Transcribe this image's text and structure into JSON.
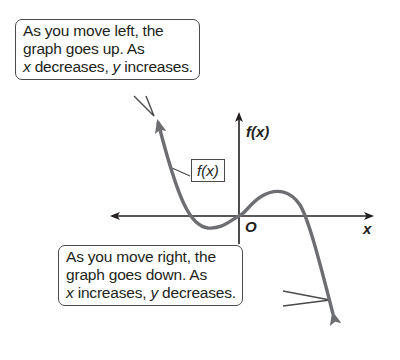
{
  "callouts": {
    "top": {
      "line1": "As you move left, the",
      "line2": "graph goes up. As",
      "line3_var1": "x",
      "line3_mid": " decreases, ",
      "line3_var2": "y",
      "line3_end": " increases."
    },
    "bottom": {
      "line1": "As you move right, the",
      "line2": "graph goes down. As",
      "line3_var1": "x",
      "line3_mid": " increases, ",
      "line3_var2": "y",
      "line3_end": " decreases."
    }
  },
  "curve_label": "f(x)",
  "axes": {
    "y_label": "f(x)",
    "x_label": "x",
    "origin_label": "O"
  },
  "colors": {
    "curve": "#6d6e71",
    "axis": "#231f20",
    "callout_border": "#4a4a4a"
  }
}
